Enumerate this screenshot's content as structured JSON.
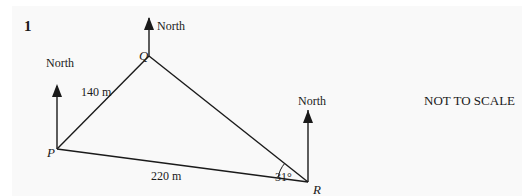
{
  "question": {
    "number": "1"
  },
  "diagram": {
    "points": {
      "P": {
        "label": "P",
        "x": 57,
        "y": 149
      },
      "Q": {
        "label": "Q",
        "x": 149,
        "y": 56
      },
      "R": {
        "label": "R",
        "x": 308,
        "y": 182
      }
    },
    "north_label": "North",
    "north_arrows": [
      {
        "at": "P",
        "label": "North"
      },
      {
        "at": "Q",
        "label": "North"
      },
      {
        "at": "R",
        "label": "North"
      }
    ],
    "sides": [
      {
        "from": "P",
        "to": "Q",
        "length": "140 m"
      },
      {
        "from": "P",
        "to": "R",
        "length": "220 m"
      },
      {
        "from": "Q",
        "to": "R",
        "length": ""
      }
    ],
    "angles": [
      {
        "at": "R",
        "between": [
          "P",
          "Q"
        ],
        "value": "31°"
      }
    ],
    "note": "NOT TO SCALE"
  },
  "colors": {
    "line": "#1a1a1a",
    "background": "#f9f9f9"
  }
}
